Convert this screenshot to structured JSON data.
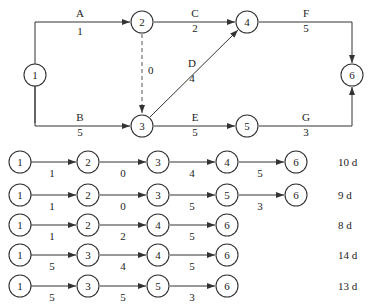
{
  "network": {
    "nodes": [
      {
        "id": "1",
        "x": 12,
        "y": 75
      },
      {
        "id": "2",
        "x": 142,
        "y": 23
      },
      {
        "id": "3",
        "x": 142,
        "y": 126
      },
      {
        "id": "4",
        "x": 247,
        "y": 23
      },
      {
        "id": "5",
        "x": 247,
        "y": 126
      },
      {
        "id": "6",
        "x": 352,
        "y": 75
      }
    ],
    "activities": [
      {
        "name": "A",
        "duration": "1",
        "from": "1",
        "to": "2"
      },
      {
        "name": "B",
        "duration": "5",
        "from": "1",
        "to": "3"
      },
      {
        "name": "C",
        "duration": "2",
        "from": "2",
        "to": "4"
      },
      {
        "name": "D",
        "duration": "4",
        "from": "3",
        "to": "4"
      },
      {
        "name": "E",
        "duration": "5",
        "from": "3",
        "to": "5"
      },
      {
        "name": "F",
        "duration": "5",
        "from": "4",
        "to": "6"
      },
      {
        "name": "G",
        "duration": "3",
        "from": "5",
        "to": "6"
      },
      {
        "name": "",
        "duration": "0",
        "from": "2",
        "to": "3",
        "dummy": true
      }
    ]
  },
  "paths": [
    {
      "nodes": [
        "1",
        "2",
        "3",
        "4",
        "6"
      ],
      "durations": [
        "1",
        "0",
        "4",
        "5"
      ],
      "total": "10 d"
    },
    {
      "nodes": [
        "1",
        "2",
        "3",
        "5",
        "6"
      ],
      "durations": [
        "1",
        "0",
        "5",
        "3"
      ],
      "total": "9 d"
    },
    {
      "nodes": [
        "1",
        "2",
        "4",
        "6"
      ],
      "durations": [
        "1",
        "2",
        "5"
      ],
      "total": "8 d"
    },
    {
      "nodes": [
        "1",
        "3",
        "4",
        "6"
      ],
      "durations": [
        "5",
        "4",
        "5"
      ],
      "total": "14 d"
    },
    {
      "nodes": [
        "1",
        "3",
        "5",
        "6"
      ],
      "durations": [
        "5",
        "5",
        "3"
      ],
      "total": "13 d"
    }
  ]
}
